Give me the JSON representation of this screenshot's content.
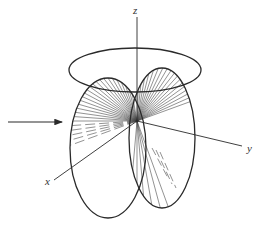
{
  "diagram": {
    "title": "",
    "axes": {
      "x_label": "x",
      "y_label": "y",
      "z_label": "z"
    },
    "incident_arrow": "incoming-wave-arrow",
    "colors": {
      "line": "#2a2a2a",
      "ray": "#4a4a4a",
      "background": "#ffffff"
    }
  }
}
